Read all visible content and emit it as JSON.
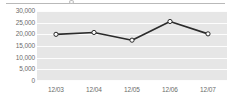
{
  "chart_data": {
    "type": "line",
    "title": "",
    "subtitle": "",
    "xlabel": "",
    "ylabel": "",
    "categories": [
      "12/03",
      "12/04",
      "12/05",
      "12/06",
      "12/07"
    ],
    "values": [
      20000,
      20800,
      17500,
      25500,
      20200
    ],
    "series": [
      {
        "name": "",
        "values": [
          20000,
          20800,
          17500,
          25500,
          20200
        ]
      }
    ],
    "ylim": [
      0,
      30000
    ],
    "yticks": [
      0,
      5000,
      10000,
      15000,
      20000,
      25000,
      30000
    ],
    "ytick_labels": [
      "0",
      "5,000",
      "10,000",
      "15,000",
      "20,000",
      "25,000",
      "30,000"
    ],
    "grid": true,
    "grid_color": "#fdfdfd",
    "plot_background": "#e6e6e6",
    "legend": false,
    "legend_position": "none",
    "line_color": "#2b2b2b",
    "marker_fill": "#ffffff",
    "marker_edge": "#2b2b2b",
    "marker_shape": "circle",
    "axis_label_color": "#6b6b6b"
  }
}
